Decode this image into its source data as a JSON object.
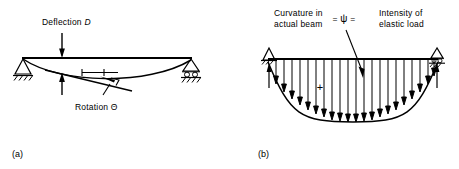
{
  "figure": {
    "panels": [
      {
        "key": "a",
        "caption": "(a)",
        "labels": {
          "deflection": "Deflection",
          "deflection_symbol": "D",
          "rotation": "Rotation",
          "rotation_symbol": "Θ"
        },
        "supports": {
          "left": "pin-support",
          "right": "roller-support"
        },
        "annotations": [
          "deflection-arrow-down",
          "deflection-arrow-up",
          "tangent-line",
          "horizontal-reference-line",
          "rotation-angle-tick"
        ]
      },
      {
        "key": "b",
        "caption": "(b)",
        "labels": {
          "left_line1": "Curvature in",
          "left_line2": "actual beam",
          "equals_left": "=",
          "psi_symbol": "ψ",
          "equals_right": "=",
          "right_line1": "Intensity of",
          "right_line2": "elastic load",
          "plus_sign": "+"
        },
        "supports": {
          "left": "pin-support",
          "right": "roller-support"
        },
        "load": {
          "type": "parabolic-distributed-load",
          "arrow_count": 21,
          "direction": "downward",
          "reaction_arrows": 2,
          "reaction_direction": "upward"
        },
        "annotations": [
          "psi-leader-arrow",
          "load-boundary-curve",
          "beam-top-line"
        ]
      }
    ],
    "colors": {
      "ink": "#000000",
      "background": "#ffffff"
    }
  }
}
